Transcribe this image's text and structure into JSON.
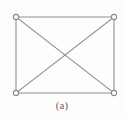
{
  "figure": {
    "caption": "(a)",
    "canvas": {
      "width": 124,
      "height": 118,
      "background": "#fdfdfd"
    },
    "style": {
      "edge_color": "#8f8f8f",
      "edge_width": 1.1,
      "vertex_stroke_color": "#8a8a8a",
      "vertex_fill_color": "#ffffff",
      "vertex_stroke_width": 1.1,
      "vertex_radius": 2.6,
      "caption_color": "#5d5d5d"
    },
    "nodes": [
      {
        "id": "top-left",
        "label": "",
        "x": 16,
        "y": 17
      },
      {
        "id": "top-right",
        "label": "",
        "x": 114,
        "y": 17
      },
      {
        "id": "bottom-left",
        "label": "",
        "x": 16,
        "y": 93
      },
      {
        "id": "bottom-right",
        "label": "",
        "x": 114,
        "y": 93
      }
    ],
    "edges": [
      {
        "id": "edge-top",
        "from": "top-left",
        "to": "top-right",
        "kind": "side"
      },
      {
        "id": "edge-right",
        "from": "top-right",
        "to": "bottom-right",
        "kind": "side"
      },
      {
        "id": "edge-bottom",
        "from": "bottom-left",
        "to": "bottom-right",
        "kind": "side"
      },
      {
        "id": "edge-left",
        "from": "top-left",
        "to": "bottom-left",
        "kind": "side"
      },
      {
        "id": "edge-diagonal-primary",
        "from": "top-left",
        "to": "bottom-right",
        "kind": "diagonal"
      },
      {
        "id": "edge-diagonal-secondary",
        "from": "top-right",
        "to": "bottom-left",
        "kind": "diagonal"
      }
    ],
    "crossing_point": {
      "x": 65,
      "y": 55
    }
  }
}
